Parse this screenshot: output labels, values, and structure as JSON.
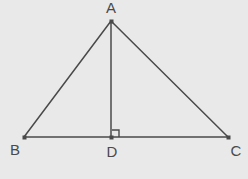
{
  "figure": {
    "background_color": "#e9e9e9",
    "stroke_color": "#4a4a4a",
    "label_color": "#4a4a4a",
    "width": 248,
    "height": 179
  },
  "points": {
    "A": {
      "label": "A",
      "x": 111,
      "y": 21,
      "label_x": 111,
      "label_y": 9
    },
    "B": {
      "label": "B",
      "x": 24,
      "y": 137,
      "label_x": 15,
      "label_y": 151
    },
    "C": {
      "label": "C",
      "x": 228,
      "y": 137,
      "label_x": 236,
      "label_y": 152
    },
    "D": {
      "label": "D",
      "x": 111,
      "y": 137,
      "label_x": 112,
      "label_y": 153
    }
  },
  "segments": {
    "AB": {
      "name": "side-ab",
      "x1": 111,
      "y1": 21,
      "x2": 24,
      "y2": 137
    },
    "AC": {
      "name": "side-ac",
      "x1": 111,
      "y1": 21,
      "x2": 228,
      "y2": 137
    },
    "BC": {
      "name": "base-bc",
      "x1": 24,
      "y1": 137,
      "x2": 228,
      "y2": 137
    },
    "AD": {
      "name": "altitude-ad",
      "x1": 111,
      "y1": 21,
      "x2": 111,
      "y2": 137
    }
  },
  "right_angle": {
    "at_point": "D",
    "marker_path": "M 112 130 L 119 130 L 119 137",
    "size": 7
  },
  "vertex_dot_size": 3
}
